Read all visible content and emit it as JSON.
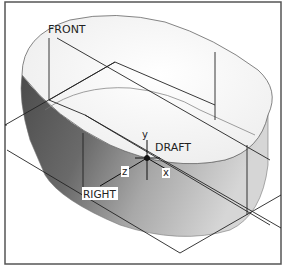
{
  "viewport": {
    "title": "3D model viewport"
  },
  "labels": {
    "front": "FRONT",
    "right": "RIGHT",
    "draft": "DRAFT",
    "axis_y": "y",
    "axis_z": "z",
    "axis_x": "x"
  },
  "colors": {
    "frame": "#555555",
    "top_face": "#fbfbfb",
    "side_dark": "#5a5a5a",
    "side_light": "#bdbdbd",
    "line": "#222222"
  }
}
